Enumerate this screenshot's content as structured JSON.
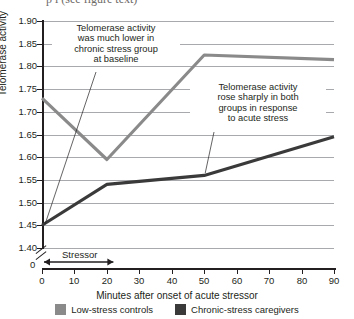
{
  "caption_partial": "p      l  (see figure text)",
  "chart_data": {
    "type": "line",
    "title": "",
    "xlabel": "Minutes after onset of acute stressor",
    "ylabel": "Telomerase activity",
    "x": [
      0,
      20,
      50,
      90
    ],
    "xlim": [
      0,
      90
    ],
    "ylim": [
      1.4,
      1.9
    ],
    "grid": true,
    "legend_position": "bottom",
    "xticks": [
      "0",
      "10",
      "20",
      "30",
      "40",
      "50",
      "60",
      "70",
      "80",
      "90"
    ],
    "xtick_values": [
      0,
      10,
      20,
      30,
      40,
      50,
      60,
      70,
      80,
      90
    ],
    "yticks": [
      "1.40",
      "1.45",
      "1.50",
      "1.55",
      "1.60",
      "1.65",
      "1.70",
      "1.75",
      "1.80",
      "1.85",
      "1.90"
    ],
    "ytick_values": [
      1.4,
      1.45,
      1.5,
      1.55,
      1.6,
      1.65,
      1.7,
      1.75,
      1.8,
      1.85,
      1.9
    ],
    "axis_break_label": "0",
    "series": [
      {
        "name": "Low-stress controls",
        "color": "#8a8a8a",
        "values": [
          1.73,
          1.595,
          1.825,
          1.815
        ]
      },
      {
        "name": "Chronic-stress caregivers",
        "color": "#3a3a3a",
        "values": [
          1.45,
          1.54,
          1.56,
          1.645
        ]
      }
    ],
    "annotations": [
      {
        "text": "Telomerase activity\nwas much lower in\nchronic stress group\nat baseline",
        "points_to_x": 0,
        "points_to_y": 1.45
      },
      {
        "text": "Telomerase activity\nrose sharply in both\ngroups in response\nto acute stress",
        "points_to_x": 50,
        "points_to_y": 1.56
      }
    ],
    "bracket": {
      "label": "Stressor",
      "from_x": 0,
      "to_x": 22
    }
  },
  "legend": {
    "items": [
      {
        "label": "Low-stress controls",
        "color": "#8a8a8a"
      },
      {
        "label": "Chronic-stress caregivers",
        "color": "#3a3a3a"
      }
    ]
  }
}
